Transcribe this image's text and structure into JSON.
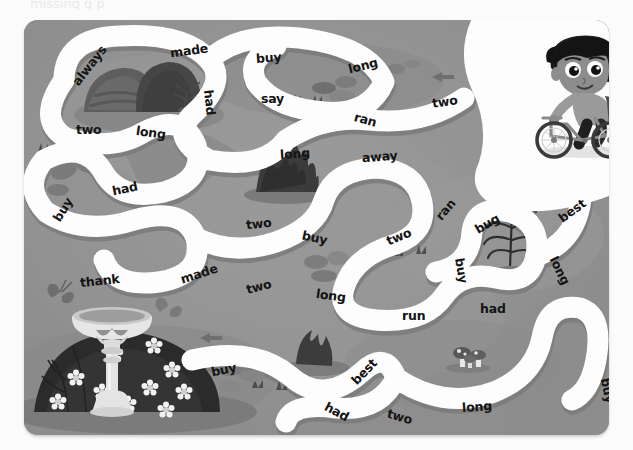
{
  "page": {
    "title_faint": "missing  g   p",
    "kind": "word-maze-worksheet",
    "colors": {
      "board_bg": "#8e8e8e",
      "path_fill": "#fdfdfd",
      "path_shadow": "#7c7c7c",
      "grass_patch": "#9b9b9b",
      "dark_object": "#4a4a4a",
      "word_text": "#141414",
      "page_bg": "#fbfbfb"
    }
  },
  "maze": {
    "start_label": "boy-on-bicycle",
    "word_count": 36,
    "words": [
      {
        "id": "w01",
        "text": "always",
        "x": 42,
        "y": 38,
        "rot": -52
      },
      {
        "id": "w02",
        "text": "made",
        "x": 146,
        "y": 23,
        "rot": -8
      },
      {
        "id": "w03",
        "text": "buy",
        "x": 232,
        "y": 30,
        "rot": -4
      },
      {
        "id": "w04",
        "text": "long",
        "x": 324,
        "y": 38,
        "rot": -14
      },
      {
        "id": "w05",
        "text": "say",
        "x": 237,
        "y": 71,
        "rot": 0
      },
      {
        "id": "w06",
        "text": "had",
        "x": 173,
        "y": 75,
        "rot": 84
      },
      {
        "id": "w07",
        "text": "ran",
        "x": 330,
        "y": 92,
        "rot": 16
      },
      {
        "id": "w08",
        "text": "two",
        "x": 408,
        "y": 74,
        "rot": -8
      },
      {
        "id": "w09",
        "text": "two",
        "x": 52,
        "y": 102,
        "rot": 0
      },
      {
        "id": "w10",
        "text": "long",
        "x": 112,
        "y": 105,
        "rot": 8
      },
      {
        "id": "w11",
        "text": "long",
        "x": 256,
        "y": 126,
        "rot": -4
      },
      {
        "id": "w12",
        "text": "away",
        "x": 338,
        "y": 129,
        "rot": -4
      },
      {
        "id": "w13",
        "text": "buy",
        "x": 26,
        "y": 182,
        "rot": -58
      },
      {
        "id": "w14",
        "text": "had",
        "x": 88,
        "y": 161,
        "rot": -12
      },
      {
        "id": "w15",
        "text": "ran",
        "x": 410,
        "y": 182,
        "rot": -50
      },
      {
        "id": "w16",
        "text": "bug",
        "x": 450,
        "y": 196,
        "rot": -30
      },
      {
        "id": "w17",
        "text": "best",
        "x": 533,
        "y": 183,
        "rot": -36
      },
      {
        "id": "w18",
        "text": "two",
        "x": 222,
        "y": 196,
        "rot": -6
      },
      {
        "id": "w19",
        "text": "buy",
        "x": 278,
        "y": 210,
        "rot": 12
      },
      {
        "id": "w20",
        "text": "two",
        "x": 362,
        "y": 209,
        "rot": -22
      },
      {
        "id": "w21",
        "text": "buy",
        "x": 425,
        "y": 243,
        "rot": 80
      },
      {
        "id": "w22",
        "text": "long",
        "x": 521,
        "y": 243,
        "rot": 64
      },
      {
        "id": "w23",
        "text": "thank",
        "x": 56,
        "y": 253,
        "rot": -6
      },
      {
        "id": "w24",
        "text": "made",
        "x": 156,
        "y": 246,
        "rot": -18
      },
      {
        "id": "w25",
        "text": "two",
        "x": 222,
        "y": 259,
        "rot": -14
      },
      {
        "id": "w26",
        "text": "long",
        "x": 292,
        "y": 268,
        "rot": 8
      },
      {
        "id": "w27",
        "text": "run",
        "x": 378,
        "y": 288,
        "rot": 0
      },
      {
        "id": "w28",
        "text": "had",
        "x": 456,
        "y": 281,
        "rot": 0
      },
      {
        "id": "w29",
        "text": "buy",
        "x": 187,
        "y": 342,
        "rot": -12
      },
      {
        "id": "w30",
        "text": "best",
        "x": 325,
        "y": 344,
        "rot": -46
      },
      {
        "id": "w31",
        "text": "long",
        "x": 438,
        "y": 379,
        "rot": -4
      },
      {
        "id": "w32",
        "text": "buy",
        "x": 571,
        "y": 363,
        "rot": 78
      },
      {
        "id": "w33",
        "text": "had",
        "x": 300,
        "y": 384,
        "rot": 28
      },
      {
        "id": "w34",
        "text": "two",
        "x": 363,
        "y": 389,
        "rot": 16
      }
    ]
  },
  "decorations": {
    "items": [
      {
        "name": "rocks-boulders",
        "at": "top-left"
      },
      {
        "name": "boy-on-bicycle",
        "at": "top-right"
      },
      {
        "name": "shrub-bush",
        "at": "center"
      },
      {
        "name": "fern-plant",
        "at": "right"
      },
      {
        "name": "birdbath-fountain",
        "at": "bottom-left"
      },
      {
        "name": "flower-mound",
        "at": "bottom-left"
      },
      {
        "name": "butterfly",
        "at": "bottom-left"
      },
      {
        "name": "mushrooms",
        "at": "bottom-center"
      },
      {
        "name": "grass-tufts",
        "at": "scattered"
      },
      {
        "name": "pebbles-stones",
        "at": "scattered"
      }
    ]
  }
}
